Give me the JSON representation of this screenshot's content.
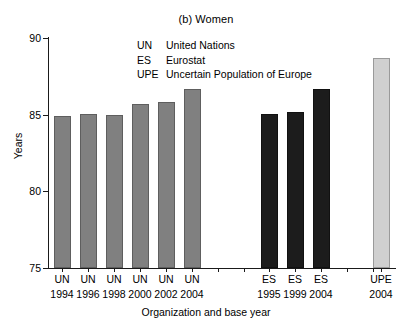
{
  "chart_data": {
    "type": "bar",
    "title": "(b) Women",
    "xlabel": "Organization and base year",
    "ylabel": "Years",
    "ylim": [
      75,
      90
    ],
    "yticks": [
      75,
      80,
      85,
      90
    ],
    "grid": false,
    "legend_position": "inside-top-center",
    "categories": [
      "UN 1994",
      "UN 1996",
      "UN 1998",
      "UN 2000",
      "UN 2002",
      "UN 2004",
      "ES 1995",
      "ES 1999",
      "ES 2004",
      "UPE 2004"
    ],
    "values": [
      84.9,
      85.05,
      85.0,
      85.7,
      85.8,
      86.7,
      85.05,
      85.15,
      86.7,
      88.7
    ],
    "bars": [
      {
        "org": "UN",
        "year": "1994",
        "value": 84.9,
        "group": "un"
      },
      {
        "org": "UN",
        "year": "1996",
        "value": 85.05,
        "group": "un"
      },
      {
        "org": "UN",
        "year": "1998",
        "value": 85.0,
        "group": "un"
      },
      {
        "org": "UN",
        "year": "2000",
        "value": 85.7,
        "group": "un"
      },
      {
        "org": "UN",
        "year": "2002",
        "value": 85.8,
        "group": "un"
      },
      {
        "org": "UN",
        "year": "2004",
        "value": 86.7,
        "group": "un"
      },
      {
        "org": "ES",
        "year": "1995",
        "value": 85.05,
        "group": "es"
      },
      {
        "org": "ES",
        "year": "1999",
        "value": 85.15,
        "group": "es"
      },
      {
        "org": "ES",
        "year": "2004",
        "value": 86.7,
        "group": "es"
      },
      {
        "org": "UPE",
        "year": "2004",
        "value": 88.7,
        "group": "upe"
      }
    ],
    "legend": [
      {
        "abbr": "UN",
        "desc": "United Nations"
      },
      {
        "abbr": "ES",
        "desc": "Eurostat"
      },
      {
        "abbr": "UPE",
        "desc": "Uncertain Population of Europe"
      }
    ],
    "colors": {
      "un": "#808080",
      "es": "#1c1c1c",
      "upe": "#d0d0d0",
      "axis": "#1a1a1a",
      "text": "#000000",
      "background": "#ffffff"
    }
  }
}
